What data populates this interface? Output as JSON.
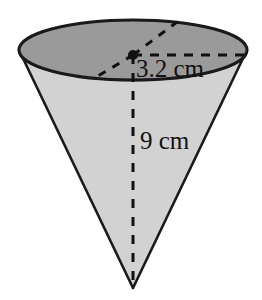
{
  "figure": {
    "name": "cone-diagram",
    "shape": "inverted-cone",
    "background_color": "#ffffff",
    "outline_color": "#1a1a1a",
    "top_face_fill": "#9a9a9a",
    "body_fill": "#d2d2d2",
    "dash_color": "#111111",
    "labels": {
      "radius": "3.2 cm",
      "height": "9 cm"
    },
    "geometry": {
      "ellipse_center_x": 133,
      "ellipse_center_y": 50,
      "ellipse_rx": 114,
      "ellipse_ry": 30,
      "apex_x": 133,
      "apex_y": 288,
      "center_dot_x": 133,
      "center_dot_y": 55
    }
  }
}
